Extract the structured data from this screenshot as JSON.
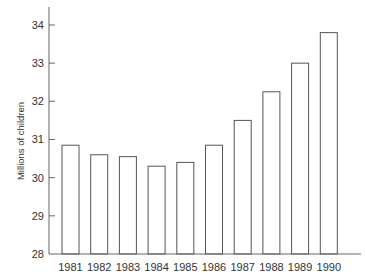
{
  "chart_data": {
    "type": "bar",
    "title": "",
    "xlabel": "",
    "ylabel": "Millions of children",
    "categories": [
      "1981",
      "1982",
      "1983",
      "1984",
      "1985",
      "1986",
      "1987",
      "1988",
      "1989",
      "1990"
    ],
    "values": [
      30.85,
      30.6,
      30.55,
      30.3,
      30.4,
      30.85,
      31.5,
      32.25,
      33.0,
      33.8
    ],
    "ylim": [
      28,
      34.5
    ],
    "yticks": [
      28,
      29,
      30,
      31,
      32,
      33,
      34
    ],
    "grid": false,
    "legend": null,
    "bar_fill": "#ffffff",
    "bar_stroke": "#555555"
  }
}
